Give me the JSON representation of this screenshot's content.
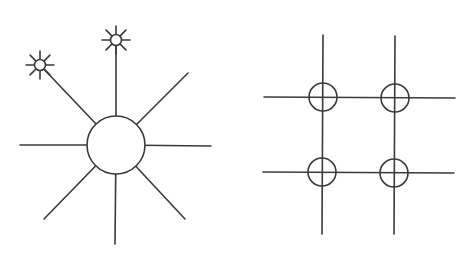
{
  "diagrams": [
    {
      "id": "star-topology",
      "type": "star network with central hub",
      "hub": {
        "cx": 116,
        "cy": 145,
        "r": 29
      },
      "spokes": [
        {
          "name": "spoke-up",
          "x2": 116,
          "y2": 40,
          "ends_in_subhub": true
        },
        {
          "name": "spoke-up-left",
          "x2": 40,
          "y2": 65,
          "ends_in_subhub": true
        },
        {
          "name": "spoke-up-right",
          "x2": 188,
          "y2": 73,
          "ends_in_subhub": false
        },
        {
          "name": "spoke-left",
          "x2": 20,
          "y2": 145,
          "ends_in_subhub": false
        },
        {
          "name": "spoke-right",
          "x2": 211,
          "y2": 146,
          "ends_in_subhub": false
        },
        {
          "name": "spoke-down-left",
          "x2": 44,
          "y2": 219,
          "ends_in_subhub": false
        },
        {
          "name": "spoke-down",
          "x2": 115,
          "y2": 244,
          "ends_in_subhub": false
        },
        {
          "name": "spoke-down-right",
          "x2": 185,
          "y2": 219,
          "ends_in_subhub": false
        }
      ],
      "subhubs": [
        {
          "name": "subhub-top",
          "cx": 116,
          "cy": 40,
          "r": 5.5,
          "ray_length": 14
        },
        {
          "name": "subhub-top-left",
          "cx": 40,
          "cy": 65,
          "r": 5.5,
          "ray_length": 14
        }
      ]
    },
    {
      "id": "mesh-grid",
      "type": "2x2 grid with nodes at intersections",
      "vertical_lines": [
        {
          "x1": 323,
          "y1": 35,
          "x2": 322,
          "y2": 234
        },
        {
          "x1": 395,
          "y1": 36,
          "x2": 394,
          "y2": 234
        }
      ],
      "horizontal_lines": [
        {
          "x1": 264,
          "y1": 97,
          "x2": 455,
          "y2": 98
        },
        {
          "x1": 263,
          "y1": 172,
          "x2": 454,
          "y2": 173
        }
      ],
      "nodes": [
        {
          "cx": 323,
          "cy": 97,
          "r": 14
        },
        {
          "cx": 395,
          "cy": 98,
          "r": 14
        },
        {
          "cx": 322,
          "cy": 172,
          "r": 14
        },
        {
          "cx": 394,
          "cy": 173,
          "r": 14
        }
      ]
    }
  ],
  "colors": {
    "line": "#3a3a3a",
    "background": "#ffffff"
  }
}
